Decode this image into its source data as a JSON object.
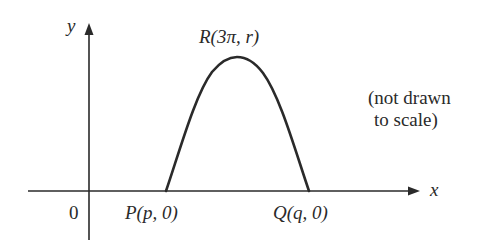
{
  "diagram": {
    "axes": {
      "x_label": "x",
      "y_label": "y",
      "origin_label": "0"
    },
    "points": {
      "P": {
        "label": "P(p, 0)"
      },
      "Q": {
        "label": "Q(q, 0)"
      },
      "R": {
        "label": "R(3π, r)"
      }
    },
    "note": {
      "line1": "(not drawn",
      "line2": "to scale)"
    },
    "colors": {
      "stroke": "#2a2a2a",
      "background": "#ffffff"
    }
  }
}
